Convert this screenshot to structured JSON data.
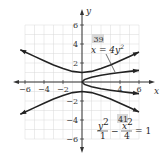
{
  "chart_data": {
    "type": "line",
    "title": "",
    "xlabel": "x",
    "ylabel": "y",
    "xlim": [
      -6.5,
      7
    ],
    "ylim": [
      -6.5,
      7
    ],
    "grid": true,
    "grid_range": [
      -6,
      6
    ],
    "x_ticks": [
      -6,
      -4,
      -2,
      4,
      6
    ],
    "x_tick_labels": [
      "−6",
      "−4",
      "−2",
      "4",
      "6"
    ],
    "y_ticks": [
      6,
      4,
      2,
      -2,
      -4,
      -6
    ],
    "y_tick_labels": [
      "6",
      "4",
      "2",
      "−2",
      "−4",
      "−6"
    ],
    "series": [
      {
        "name": "x = 4y^2",
        "label_id": "39",
        "kind": "parabola",
        "equation": "x = 4y²",
        "points_upper": [
          [
            0,
            0
          ],
          [
            0.25,
            0.25
          ],
          [
            1,
            0.5
          ],
          [
            2,
            0.707
          ],
          [
            3,
            0.866
          ],
          [
            4,
            1.0
          ],
          [
            5,
            1.118
          ],
          [
            6,
            1.225
          ]
        ],
        "points_lower": [
          [
            0,
            0
          ],
          [
            0.25,
            -0.25
          ],
          [
            1,
            -0.5
          ],
          [
            2,
            -0.707
          ],
          [
            3,
            -0.866
          ],
          [
            4,
            -1.0
          ],
          [
            5,
            -1.118
          ],
          [
            6,
            -1.225
          ]
        ]
      },
      {
        "name": "y^2/1 - x^2/4 = 1",
        "label_id": "41",
        "kind": "hyperbola",
        "equation": "y²/1 − x²/4 = 1",
        "points_upper": [
          [
            -6.5,
            3.4
          ],
          [
            -5,
            2.69
          ],
          [
            -4,
            2.24
          ],
          [
            -3,
            1.8
          ],
          [
            -2,
            1.41
          ],
          [
            -1,
            1.12
          ],
          [
            0,
            1.0
          ],
          [
            1,
            1.12
          ],
          [
            2,
            1.41
          ],
          [
            3,
            1.8
          ],
          [
            4,
            2.24
          ],
          [
            5,
            2.69
          ],
          [
            6,
            3.16
          ]
        ],
        "points_lower": [
          [
            -6.5,
            -3.4
          ],
          [
            -5,
            -2.69
          ],
          [
            -4,
            -2.24
          ],
          [
            -3,
            -1.8
          ],
          [
            -2,
            -1.41
          ],
          [
            -1,
            -1.12
          ],
          [
            0,
            -1.0
          ],
          [
            1,
            -1.12
          ],
          [
            2,
            -1.41
          ],
          [
            3,
            -1.8
          ],
          [
            4,
            -2.24
          ],
          [
            5,
            -2.69
          ],
          [
            6,
            -3.16
          ]
        ]
      }
    ],
    "annotations": [
      {
        "id": "39",
        "text": "x = 4y²",
        "points_to": "parabola"
      },
      {
        "id": "41",
        "text": "y²/1 − x²/4 = 1",
        "points_to": "hyperbola"
      }
    ]
  },
  "labels": {
    "badge_39": "39",
    "badge_41": "41",
    "eq39_lhs": "x = 4y",
    "eq39_exp": "2",
    "eq41_num1": "y",
    "eq41_den1": "1",
    "eq41_num2": "x",
    "eq41_den2": "4",
    "eq41_exp": "2",
    "eq41_minus": "−",
    "eq41_rhs": "= 1",
    "x_axis": "x",
    "y_axis": "y"
  },
  "colors": {
    "curve": "#222222",
    "axis": "#333333",
    "grid": "#d8d8d8",
    "badge_bg": "#d9d9d9"
  }
}
